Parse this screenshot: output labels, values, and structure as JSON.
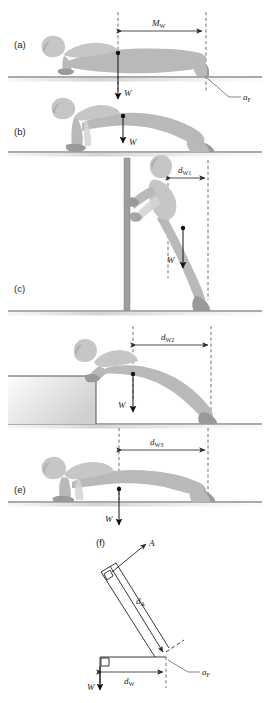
{
  "figure": {
    "background_color": "#ffffff",
    "body_color": "#b9b9b9",
    "line_color": "#3a3a3a"
  },
  "panels": [
    {
      "id": "a",
      "letter": "(a)",
      "description": "Full push-up, prone position on ground, moment arm M_W from centre of mass to feet",
      "labels": {
        "moment_arm": "M",
        "moment_arm_sub": "W",
        "weight": "W",
        "foot_axis": "a",
        "foot_axis_sub": "F"
      }
    },
    {
      "id": "b",
      "letter": "(b)",
      "description": "Push-up top position, arms extended, weight vector W through centre of mass",
      "labels": {
        "weight": "W"
      }
    },
    {
      "id": "c",
      "letter": "(c)",
      "description": "Standing wall push-up, distance d_W1 from centre of mass to feet",
      "labels": {
        "distance": "d",
        "distance_sub": "W1",
        "weight": "W"
      }
    },
    {
      "id": "d",
      "letter": "(d)",
      "description": "Inclined bench push-up, distance d_W2 from centre of mass to feet",
      "labels": {
        "distance": "d",
        "distance_sub": "W2",
        "weight": "W"
      }
    },
    {
      "id": "e",
      "letter": "(e)",
      "description": "Floor push-up, distance d_W3 from centre of mass to feet",
      "labels": {
        "distance": "d",
        "distance_sub": "W3",
        "weight": "W"
      }
    },
    {
      "id": "f",
      "letter": "(f)",
      "description": "Free body diagram: force A with moment arm d_A, weight W with moment arm d_W about foot axis a_F",
      "labels": {
        "force": "A",
        "force_arm": "d",
        "force_arm_sub": "A",
        "weight": "W",
        "weight_arm": "d",
        "weight_arm_sub": "W",
        "foot_axis": "a",
        "foot_axis_sub": "F"
      }
    }
  ]
}
